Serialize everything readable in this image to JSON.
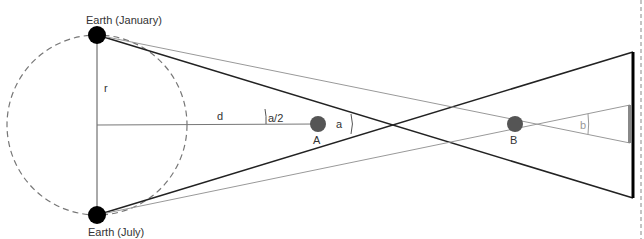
{
  "diagram": {
    "labels": {
      "earth_january": "Earth (January)",
      "earth_july": "Earth (July)",
      "radius": "r",
      "distance": "d",
      "half_angle": "a/2",
      "angle_a": "a",
      "angle_b": "b",
      "star_a": "A",
      "star_b": "B"
    },
    "colors": {
      "earth": "#000000",
      "star": "#555555",
      "orbit": "#777777",
      "line_dark": "#222222",
      "line_light": "#888888",
      "screen": "#000000",
      "screen_grey": "#888888"
    }
  }
}
